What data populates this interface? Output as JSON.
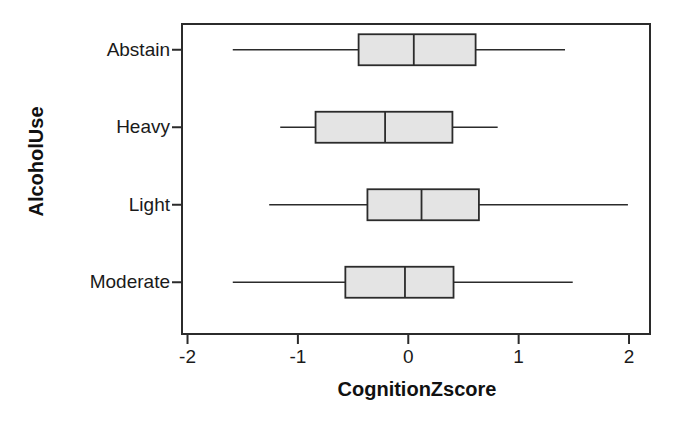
{
  "chart_data": {
    "type": "box",
    "orientation": "horizontal",
    "title": "",
    "xlabel": "CognitionZscore",
    "ylabel": "AlcoholUse",
    "xlim": [
      -2.05,
      2.19
    ],
    "xticks": [
      -2,
      -1,
      0,
      1,
      2
    ],
    "xtick_labels": [
      "-2",
      "-1",
      "0",
      "1",
      "2"
    ],
    "categories": [
      "Abstain",
      "Heavy",
      "Light",
      "Moderate"
    ],
    "grid": false,
    "legend": null,
    "box_fill": "#e4e4e4",
    "box_stroke": "#2b2b2b",
    "frame_stroke": "#2b2b2b",
    "boxes": [
      {
        "category": "Abstain",
        "whisker_low": -1.59,
        "q1": -0.45,
        "median": 0.05,
        "q3": 0.61,
        "whisker_high": 1.42
      },
      {
        "category": "Heavy",
        "whisker_low": -1.16,
        "q1": -0.84,
        "median": -0.21,
        "q3": 0.4,
        "whisker_high": 0.81
      },
      {
        "category": "Light",
        "whisker_low": -1.26,
        "q1": -0.37,
        "median": 0.12,
        "q3": 0.64,
        "whisker_high": 1.99
      },
      {
        "category": "Moderate",
        "whisker_low": -1.59,
        "q1": -0.57,
        "median": -0.03,
        "q3": 0.41,
        "whisker_high": 1.49
      }
    ]
  },
  "axis": {
    "y_tick_labels": [
      "Abstain",
      "Heavy",
      "Light",
      "Moderate"
    ],
    "x_tick_labels": [
      "-2",
      "-1",
      "0",
      "1",
      "2"
    ],
    "x_axis_title": "CognitionZscore",
    "y_axis_title": "AlcoholUse"
  }
}
